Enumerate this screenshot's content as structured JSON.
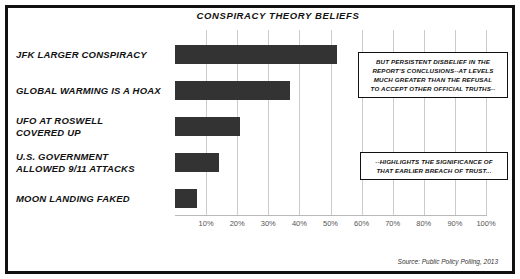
{
  "chart_data": {
    "type": "bar",
    "orientation": "horizontal",
    "title": "CONSPIRACY THEORY BELIEFS",
    "xlabel": "",
    "ylabel": "",
    "xlim": [
      0,
      100
    ],
    "grid": true,
    "legend": "none",
    "categories": [
      "JFK LARGER CONSPIRACY",
      "GLOBAL WARMING IS A HOAX",
      "UFO AT ROSWELL COVERED UP",
      "U.S. GOVERNMENT ALLOWED 9/11 ATTACKS",
      "MOON LANDING FAKED"
    ],
    "category_lines": [
      [
        "JFK LARGER CONSPIRACY"
      ],
      [
        "GLOBAL WARMING IS A HOAX"
      ],
      [
        "UFO AT ROSWELL",
        "COVERED UP"
      ],
      [
        "U.S. GOVERNMENT",
        "ALLOWED 9/11 ATTACKS"
      ],
      [
        "MOON LANDING FAKED"
      ]
    ],
    "values": [
      52,
      37,
      21,
      14,
      7
    ],
    "xticks": [
      10,
      20,
      30,
      40,
      50,
      60,
      70,
      80,
      90,
      100
    ],
    "xticklabels": [
      "10%",
      "20%",
      "30%",
      "40%",
      "50%",
      "60%",
      "70%",
      "80%",
      "90%",
      "100%"
    ],
    "bar_color": "#333333",
    "grid_color": "#cccccc",
    "annotations": [
      {
        "id": "callout-1",
        "lines": [
          "BUT PERSISTENT DISBELIEF IN THE",
          "REPORT'S CONCLUSIONS--AT LEVELS",
          "MUCH GREATER THAN THE REFUSAL",
          "TO ACCEPT OTHER OFFICIAL TRUTHS--"
        ]
      },
      {
        "id": "callout-2",
        "lines": [
          "--HIGHLIGHTS THE SIGNIFICANCE OF",
          "THAT EARLIER BREACH OF TRUST..."
        ]
      }
    ],
    "source": "Source: Public Policy Polling, 2013"
  }
}
